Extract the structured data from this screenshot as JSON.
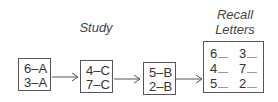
{
  "labels": {
    "study": "Study",
    "recall_line1": "Recall",
    "recall_line2": "Letters"
  },
  "study_boxes": [
    {
      "lines": [
        "6–A",
        "3–A"
      ]
    },
    {
      "lines": [
        "4–C",
        "7–C"
      ]
    },
    {
      "lines": [
        "5–B",
        "2–B"
      ]
    }
  ],
  "recall_box": {
    "left_column": [
      "6",
      "4",
      "5"
    ],
    "right_column": [
      "3",
      "7",
      "2"
    ]
  }
}
